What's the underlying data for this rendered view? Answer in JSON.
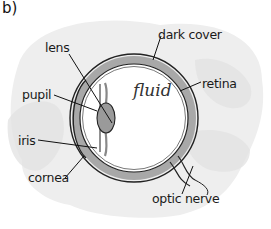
{
  "figure": {
    "label": "b)",
    "interior_text": "fluid",
    "labels": {
      "lens": "lens",
      "pupil": "pupil",
      "iris": "iris",
      "cornea": "cornea",
      "dark_cover": "dark cover",
      "retina": "retina",
      "optic_nerve": "optic nerve"
    },
    "colors": {
      "outline": "#222222",
      "sclera_band": "#a9a9a9",
      "lens_fill": "#9a9a9a",
      "background_blob": "#ececec"
    }
  }
}
